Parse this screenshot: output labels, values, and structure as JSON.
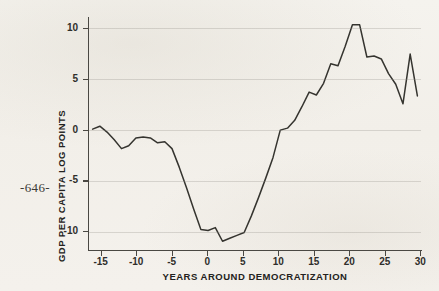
{
  "page": {
    "page_number": "-646-",
    "background_color": "#f3f1ec"
  },
  "chart_data": {
    "type": "line",
    "title": "",
    "xlabel": "YEARS AROUND DEMOCRATIZATION",
    "ylabel": "GDP PER CAPITA LOG POINTS",
    "xlim": [
      -15.5,
      30.5
    ],
    "ylim": [
      -11.8,
      12.0
    ],
    "xticks": [
      -15,
      -10,
      -5,
      0,
      5,
      10,
      15,
      20,
      25,
      30
    ],
    "xticklabels": [
      "-15",
      "-10",
      "-5",
      "0",
      "5",
      "10",
      "15",
      "20",
      "25",
      "30"
    ],
    "yticks": [
      -10,
      -5,
      0,
      5,
      10
    ],
    "yticklabels": [
      "-10",
      "-5",
      "0",
      "5",
      "10"
    ],
    "grid": "horizontal",
    "grid_color": "#8c8880",
    "line_color": "#35342f",
    "legend": "none",
    "series": [
      {
        "name": "GDP per capita (log points) around democratization",
        "x": [
          -15,
          -14,
          -13,
          -12,
          -11,
          -10,
          -9,
          -8,
          -7,
          -6,
          -5,
          -4,
          -3,
          -2,
          -1,
          0,
          1,
          2,
          3,
          4,
          5,
          6,
          7,
          8,
          9,
          10,
          11,
          12,
          13,
          14,
          15,
          16,
          17,
          18,
          19,
          20,
          21,
          22,
          23,
          24,
          25,
          26,
          27,
          28,
          29,
          30
        ],
        "values": [
          0.6,
          0.9,
          0.3,
          -0.5,
          -1.4,
          -1.1,
          -0.3,
          -0.2,
          -0.3,
          -0.8,
          -0.7,
          -1.4,
          -3.3,
          -5.4,
          -7.6,
          -9.7,
          -9.8,
          -9.5,
          -10.9,
          -10.6,
          -10.3,
          -10.0,
          -8.3,
          -6.4,
          -4.4,
          -2.3,
          0.5,
          0.7,
          1.5,
          2.9,
          4.4,
          4.1,
          5.3,
          7.3,
          7.1,
          9.1,
          11.3,
          11.3,
          8.0,
          8.1,
          7.8,
          6.3,
          5.2,
          3.2,
          8.3,
          4.0
        ]
      }
    ]
  }
}
